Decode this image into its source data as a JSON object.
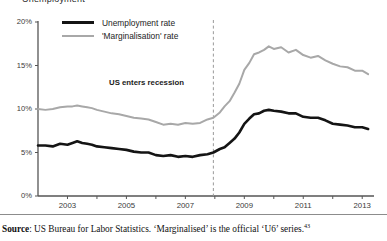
{
  "figure": {
    "clipped_title": "Unemployment",
    "annotation": "US enters recession",
    "source_prefix": "Source",
    "source_text": ": US Bureau for Labor Statistics. ‘Marginalised’ is the official ‘U6’ series.",
    "source_footnote": "43"
  },
  "colors": {
    "unemployment": "#141414",
    "marginalisation": "#a8a8a8",
    "axis": "#555555",
    "recession_line": "#9a9a9a"
  },
  "chart_data": {
    "type": "line",
    "title": "Unemployment",
    "xlabel": "",
    "ylabel": "",
    "xlim": [
      2002.0,
      2013.4
    ],
    "ylim": [
      0,
      20
    ],
    "grid": false,
    "legend_position": "top-left",
    "ytick_labels": [
      "0%",
      "5%",
      "10%",
      "15%",
      "20%"
    ],
    "ytick_values": [
      0,
      5,
      10,
      15,
      20
    ],
    "xtick_labels": [
      "2003",
      "2005",
      "2007",
      "2009",
      "2011",
      "2013"
    ],
    "xtick_values": [
      2003,
      2005,
      2007,
      2009,
      2011,
      2013
    ],
    "annotations": [
      {
        "text": "US enters recession",
        "x": 2007.95,
        "type": "vline-dashed"
      }
    ],
    "series": [
      {
        "name": "Unemployment rate",
        "color": "#141414",
        "x": [
          2002.0,
          2002.25,
          2002.5,
          2002.75,
          2003.0,
          2003.17,
          2003.33,
          2003.5,
          2003.67,
          2003.83,
          2004.0,
          2004.25,
          2004.5,
          2004.75,
          2005.0,
          2005.25,
          2005.5,
          2005.75,
          2006.0,
          2006.25,
          2006.5,
          2006.75,
          2007.0,
          2007.25,
          2007.5,
          2007.75,
          2007.95,
          2008.17,
          2008.33,
          2008.5,
          2008.67,
          2008.83,
          2009.0,
          2009.17,
          2009.33,
          2009.5,
          2009.67,
          2009.83,
          2010.0,
          2010.25,
          2010.5,
          2010.75,
          2011.0,
          2011.25,
          2011.5,
          2011.75,
          2012.0,
          2012.25,
          2012.5,
          2012.75,
          2013.0,
          2013.2
        ],
        "values": [
          5.8,
          5.8,
          5.7,
          6.0,
          5.9,
          6.1,
          6.3,
          6.1,
          6.0,
          5.9,
          5.7,
          5.6,
          5.5,
          5.4,
          5.3,
          5.1,
          5.0,
          5.0,
          4.7,
          4.6,
          4.7,
          4.5,
          4.6,
          4.5,
          4.7,
          4.8,
          5.0,
          5.4,
          5.6,
          6.1,
          6.6,
          7.3,
          8.3,
          8.9,
          9.4,
          9.5,
          9.8,
          9.9,
          9.8,
          9.7,
          9.5,
          9.5,
          9.1,
          9.0,
          9.0,
          8.7,
          8.3,
          8.2,
          8.1,
          7.9,
          7.9,
          7.7
        ]
      },
      {
        "name": "'Marginalisation' rate",
        "color": "#a8a8a8",
        "x": [
          2002.0,
          2002.25,
          2002.5,
          2002.75,
          2003.0,
          2003.17,
          2003.33,
          2003.5,
          2003.67,
          2003.83,
          2004.0,
          2004.25,
          2004.5,
          2004.75,
          2005.0,
          2005.25,
          2005.5,
          2005.75,
          2006.0,
          2006.25,
          2006.5,
          2006.75,
          2007.0,
          2007.25,
          2007.5,
          2007.75,
          2007.95,
          2008.17,
          2008.33,
          2008.5,
          2008.67,
          2008.83,
          2009.0,
          2009.17,
          2009.33,
          2009.5,
          2009.67,
          2009.83,
          2010.0,
          2010.25,
          2010.5,
          2010.75,
          2011.0,
          2011.25,
          2011.5,
          2011.75,
          2012.0,
          2012.25,
          2012.5,
          2012.75,
          2013.0,
          2013.2
        ],
        "values": [
          10.0,
          9.9,
          10.0,
          10.2,
          10.3,
          10.3,
          10.4,
          10.3,
          10.2,
          10.1,
          9.9,
          9.7,
          9.5,
          9.4,
          9.2,
          9.0,
          8.9,
          8.8,
          8.5,
          8.2,
          8.3,
          8.2,
          8.4,
          8.3,
          8.4,
          8.8,
          9.0,
          9.6,
          10.3,
          10.9,
          11.9,
          12.9,
          14.5,
          15.3,
          16.3,
          16.5,
          16.8,
          17.2,
          16.9,
          17.1,
          16.5,
          16.8,
          16.2,
          15.9,
          16.1,
          15.6,
          15.2,
          14.9,
          14.8,
          14.4,
          14.4,
          14.0
        ]
      }
    ]
  }
}
